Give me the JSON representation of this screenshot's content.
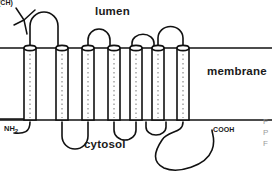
{
  "figure": {
    "name": "membrane-protein-topology-diagram",
    "width": 272,
    "height": 171,
    "background": "#ffffff",
    "stroke_color": "#111111",
    "text_color": "#1a1a1a"
  },
  "labels": {
    "lumen": "lumen",
    "membrane": "membrane",
    "cytosol": "cytosol",
    "n_terminus": "NH",
    "n_terminus_sub": "2",
    "c_terminus": "COOH",
    "carbohydrate": "(CH)"
  },
  "edge_fragments": {
    "line1": "F",
    "line2": "P",
    "line3": "F"
  },
  "topology": {
    "transmembrane_helices": 7,
    "membrane_top_y": 48,
    "membrane_bottom_y": 120,
    "lumenal_loops": 3,
    "cytosolic_loops": 3,
    "n_terminus_side": "cytosol",
    "c_terminus_side": "cytosol",
    "helix_style": "cylinder-with-dotted-interior",
    "helices": [
      {
        "id": 1,
        "x_left": 24,
        "x_right": 36
      },
      {
        "id": 2,
        "x_left": 56,
        "x_right": 68
      },
      {
        "id": 3,
        "x_left": 82,
        "x_right": 94
      },
      {
        "id": 4,
        "x_left": 108,
        "x_right": 120
      },
      {
        "id": 5,
        "x_left": 130,
        "x_right": 142
      },
      {
        "id": 6,
        "x_left": 152,
        "x_right": 164
      },
      {
        "id": 7,
        "x_left": 177,
        "x_right": 189
      }
    ]
  }
}
